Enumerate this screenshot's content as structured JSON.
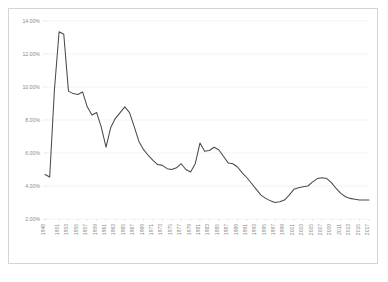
{
  "chart_data": {
    "type": "line",
    "title": "",
    "subtitle": "",
    "xlabel": "",
    "ylabel": "",
    "ylim": [
      2.0,
      14.0
    ],
    "ytick_values": [
      2.0,
      4.0,
      6.0,
      8.0,
      10.0,
      12.0,
      14.0
    ],
    "ytick_labels": [
      "2.00%",
      "4.00%",
      "6.00%",
      "8.00%",
      "10.00%",
      "12.00%",
      "14.00%"
    ],
    "grid": true,
    "legend": "none",
    "xtick_labels": [
      "1948",
      "1951",
      "1953",
      "1955",
      "1957",
      "1959",
      "1961",
      "1963",
      "1965",
      "1967",
      "1969",
      "1971",
      "1973",
      "1975",
      "1977",
      "1979",
      "1981",
      "1983",
      "1985",
      "1987",
      "1989",
      "1991",
      "1993",
      "1995",
      "1997",
      "1999",
      "2001",
      "2003",
      "2005",
      "2007",
      "2009",
      "2011",
      "2013",
      "2015",
      "2017"
    ],
    "series": [
      {
        "name": "Rate",
        "x": [
          1948,
          1949,
          1950,
          1951,
          1952,
          1953,
          1954,
          1955,
          1956,
          1957,
          1958,
          1959,
          1960,
          1961,
          1962,
          1963,
          1964,
          1965,
          1966,
          1967,
          1968,
          1969,
          1970,
          1971,
          1972,
          1973,
          1974,
          1975,
          1976,
          1977,
          1978,
          1979,
          1980,
          1981,
          1982,
          1983,
          1984,
          1985,
          1986,
          1987,
          1988,
          1989,
          1990,
          1991,
          1992,
          1993,
          1994,
          1995,
          1996,
          1997,
          1998,
          1999,
          2000,
          2001,
          2002,
          2003,
          2004,
          2005,
          2006,
          2007,
          2008,
          2009,
          2010,
          2011,
          2012,
          2013,
          2014,
          2015,
          2016,
          2017
        ],
        "values": [
          4.7,
          4.55,
          9.8,
          13.35,
          13.2,
          9.75,
          9.6,
          9.55,
          9.7,
          8.8,
          8.3,
          8.45,
          7.55,
          6.35,
          7.55,
          8.1,
          8.45,
          8.8,
          8.45,
          7.6,
          6.7,
          6.2,
          5.85,
          5.55,
          5.3,
          5.25,
          5.05,
          5.0,
          5.1,
          5.35,
          5.0,
          4.85,
          5.35,
          6.6,
          6.1,
          6.15,
          6.35,
          6.2,
          5.8,
          5.4,
          5.35,
          5.15,
          4.8,
          4.5,
          4.15,
          3.8,
          3.45,
          3.25,
          3.1,
          3.0,
          3.05,
          3.15,
          3.45,
          3.8,
          3.9,
          3.95,
          4.0,
          4.25,
          4.45,
          4.5,
          4.45,
          4.2,
          3.85,
          3.55,
          3.35,
          3.25,
          3.2,
          3.15,
          3.15,
          3.15
        ]
      }
    ]
  }
}
